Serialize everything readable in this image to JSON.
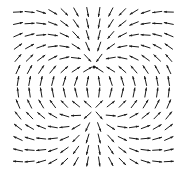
{
  "diagram": {
    "type": "vector_field",
    "canvas": {
      "width": 188,
      "height": 182
    },
    "grid": {
      "cols": 14,
      "rows": 14,
      "x_start": 18,
      "x_step": 11.6,
      "y_start": 12,
      "y_step": 11.5
    },
    "sink": {
      "x": 94,
      "y": 67,
      "strength": 1.0
    },
    "source": {
      "x": 94,
      "y": 108,
      "strength": 1.0
    },
    "arrow": {
      "length": 10,
      "head_length": 3,
      "head_width": 2.2,
      "stroke_width": 1,
      "color": "#1a1a1a"
    },
    "background": "#ffffff"
  }
}
